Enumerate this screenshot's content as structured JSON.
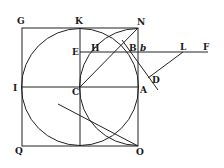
{
  "diagram": {
    "stroke_color": "#222222",
    "background": "#ffffff",
    "labels": {
      "G": "G",
      "K": "K",
      "N": "N",
      "E": "E",
      "H": "H",
      "B": "B",
      "b": "b",
      "L": "L",
      "F": "F",
      "D": "D",
      "I": "I",
      "C": "C",
      "A": "A",
      "Q": "Q",
      "O": "O"
    },
    "points": {
      "G": [
        22,
        28
      ],
      "K": [
        80,
        28
      ],
      "N": [
        138,
        28
      ],
      "E": [
        80,
        52
      ],
      "H": [
        97,
        52
      ],
      "B": [
        128,
        52
      ],
      "b": [
        138,
        52
      ],
      "L": [
        183,
        52
      ],
      "F": [
        208,
        52
      ],
      "D": [
        152,
        75
      ],
      "I": [
        22,
        87
      ],
      "C": [
        80,
        87
      ],
      "A": [
        138,
        87
      ],
      "Q": [
        22,
        146
      ],
      "O": [
        138,
        146
      ]
    }
  }
}
